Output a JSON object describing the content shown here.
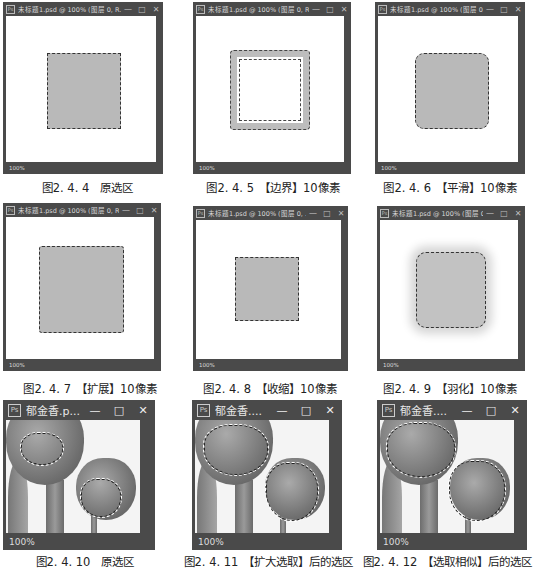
{
  "windows": [
    {
      "id": "2.4.4",
      "title": "未标题1.psd @ 100% (图层 0, R...",
      "zoom": "100%",
      "caption": "图2. 4. 4　原选区",
      "effect": "original"
    },
    {
      "id": "2.4.5",
      "title": "未标题1.psd @ 100% (图层 0, R...",
      "zoom": "100%",
      "caption": "图2. 4. 5　【边界】10像素",
      "effect": "border"
    },
    {
      "id": "2.4.6",
      "title": "未标题1.psd @ 100% (图层 0, R...",
      "zoom": "100%",
      "caption": "图2. 4. 6　【平滑】10像素",
      "effect": "smooth"
    },
    {
      "id": "2.4.7",
      "title": "未标题1.psd @ 100% (图层 0, R...",
      "zoom": "100%",
      "caption": "图2. 4. 7　【扩展】10像素",
      "effect": "expand"
    },
    {
      "id": "2.4.8",
      "title": "未标题1.psd @ 100% (图层 0, ...",
      "zoom": "100%",
      "caption": "图2. 4. 8　【收缩】10像素",
      "effect": "contract"
    },
    {
      "id": "2.4.9",
      "title": "未标题1.psd @ 100% (图层 0, R...",
      "zoom": "100%",
      "caption": "图2. 4. 9　【羽化】10像素",
      "effect": "feather"
    },
    {
      "id": "2.4.10",
      "title": "郁金香.p...",
      "zoom": "100%",
      "caption": "图2. 4. 10　原选区",
      "effect": "tulip-original"
    },
    {
      "id": "2.4.11",
      "title": "郁金香....",
      "zoom": "100%",
      "caption": "图2. 4. 11　【扩大选取】后的选区",
      "effect": "tulip-grow"
    },
    {
      "id": "2.4.12",
      "title": "郁金香....",
      "zoom": "100%",
      "caption": "图2. 4. 12　【选取相似】后的选区",
      "effect": "tulip-similar"
    }
  ],
  "icons": {
    "app": "Ps",
    "minimize": "—",
    "maximize": "□",
    "close": "✕"
  },
  "colors": {
    "frame": "#4a4a4a",
    "canvas": "#ffffff",
    "selection_fill": "#b9b9b9",
    "marching_ants": "#333333"
  }
}
